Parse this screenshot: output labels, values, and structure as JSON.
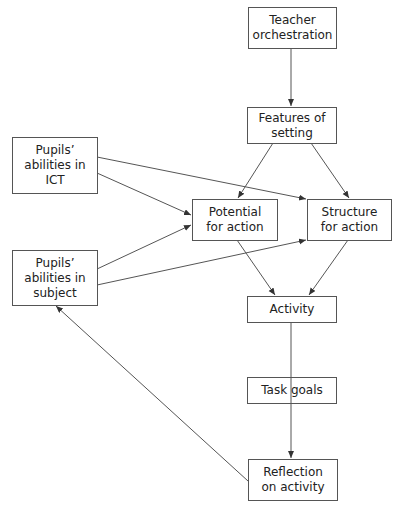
{
  "diagram": {
    "nodes": {
      "teacher": {
        "label": "Teacher\norchestration"
      },
      "features": {
        "label": "Features of\nsetting"
      },
      "pupils_ict": {
        "label": "Pupils’\nabilities in\nICT"
      },
      "pupils_subject": {
        "label": "Pupils’\nabilities in\nsubject"
      },
      "potential": {
        "label": "Potential\nfor action"
      },
      "structure": {
        "label": "Structure\nfor action"
      },
      "activity": {
        "label": "Activity"
      },
      "task_goals": {
        "label": "Task goals"
      },
      "reflection": {
        "label": "Reflection\non activity"
      }
    },
    "edges": [
      {
        "from": "teacher",
        "to": "features"
      },
      {
        "from": "features",
        "to": "potential"
      },
      {
        "from": "features",
        "to": "structure"
      },
      {
        "from": "pupils_ict",
        "to": "structure"
      },
      {
        "from": "pupils_ict",
        "to": "potential"
      },
      {
        "from": "pupils_subject",
        "to": "potential"
      },
      {
        "from": "pupils_subject",
        "to": "structure"
      },
      {
        "from": "potential",
        "to": "activity"
      },
      {
        "from": "structure",
        "to": "activity"
      },
      {
        "from": "activity",
        "to": "reflection",
        "via": "task_goals"
      },
      {
        "from": "reflection",
        "to": "pupils_subject"
      }
    ],
    "colors": {
      "line": "#555555",
      "text": "#222222",
      "background": "#ffffff"
    }
  }
}
